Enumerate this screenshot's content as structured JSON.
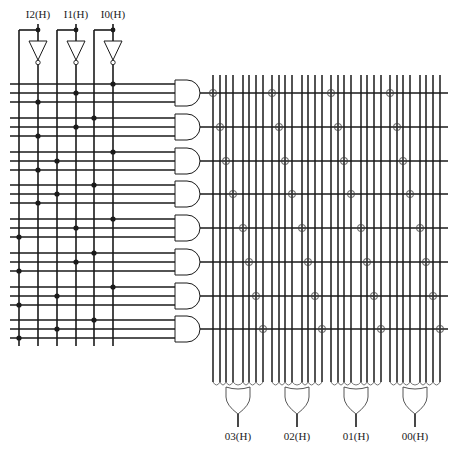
{
  "diagram": {
    "inputs": [
      {
        "label": "I2(H)",
        "x": 38,
        "true_x": 19,
        "inv_x": 38
      },
      {
        "label": "I1(H)",
        "x": 76,
        "true_x": 57,
        "inv_x": 76
      },
      {
        "label": "I0(H)",
        "x": 113,
        "true_x": 94,
        "inv_x": 113
      }
    ],
    "outputs": [
      {
        "label": "03(H)",
        "x": 238
      },
      {
        "label": "02(H)",
        "x": 297
      },
      {
        "label": "01(H)",
        "x": 356
      },
      {
        "label": "00(H)",
        "x": 415
      }
    ],
    "and_gates": [
      {
        "y": 93,
        "dots_x": [
          113,
          76,
          38
        ]
      },
      {
        "y": 127,
        "dots_x": [
          94,
          76,
          38
        ]
      },
      {
        "y": 161,
        "dots_x": [
          113,
          57,
          38
        ]
      },
      {
        "y": 194,
        "dots_x": [
          94,
          57,
          38
        ]
      },
      {
        "y": 228,
        "dots_x": [
          113,
          76,
          19
        ]
      },
      {
        "y": 262,
        "dots_x": [
          94,
          76,
          19
        ]
      },
      {
        "y": 296,
        "dots_x": [
          113,
          57,
          19
        ]
      },
      {
        "y": 329,
        "dots_x": [
          94,
          57,
          19
        ]
      }
    ],
    "or_group_starts": [
      213,
      272,
      331,
      390
    ],
    "or_line_offsets": [
      0,
      7,
      13,
      20,
      30,
      36,
      43,
      50
    ],
    "colors": {
      "line": "#1a1a1a",
      "thin": "#333333",
      "background": "#ffffff"
    }
  }
}
